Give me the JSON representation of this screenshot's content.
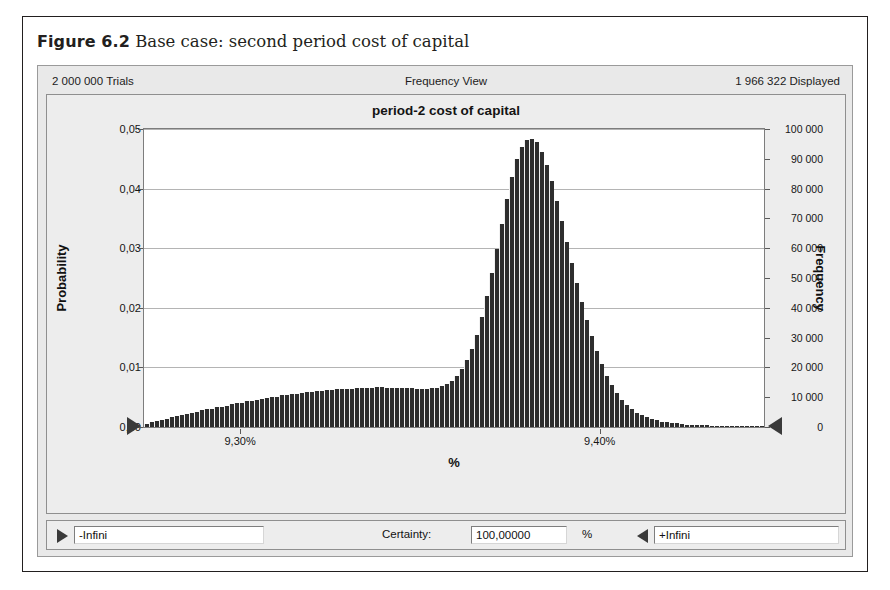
{
  "figure": {
    "label": "Figure 6.2",
    "caption": "Base case: second period cost of capital"
  },
  "window": {
    "header": {
      "trials": "2 000 000 Trials",
      "view": "Frequency View",
      "displayed": "1 966 322 Displayed"
    },
    "footer": {
      "lower_bound_value": "-Infini",
      "certainty_label": "Certainty:",
      "certainty_value": "100,00000",
      "percent_label": "%",
      "upper_bound_value": "+Infini",
      "lower_handle_icon": "triangle-right-icon",
      "upper_handle_icon": "triangle-left-icon"
    }
  },
  "chart_data": {
    "type": "bar",
    "title": "period-2 cost of capital",
    "xlabel": "%",
    "ylabel": "Probability",
    "y2label": "Frequency",
    "grid": true,
    "legend": "none",
    "ylim": [
      0,
      0.05
    ],
    "y2lim": [
      0,
      100000
    ],
    "yticks": [
      "0,00",
      "0,01",
      "0,02",
      "0,03",
      "0,04",
      "0,05"
    ],
    "ytick_values": [
      0.0,
      0.01,
      0.02,
      0.03,
      0.04,
      0.05
    ],
    "y2ticks": [
      "0",
      "10 000",
      "20 000",
      "30 000",
      "40 000",
      "50 000",
      "60 000",
      "70 000",
      "80 000",
      "90 000",
      "100 000"
    ],
    "y2tick_values": [
      0,
      10000,
      20000,
      30000,
      40000,
      50000,
      60000,
      70000,
      80000,
      90000,
      100000
    ],
    "xticks": [
      "9,30%",
      "9,40%"
    ],
    "xtick_positions": [
      0.155,
      0.735
    ],
    "xlim": [
      9.265,
      9.437
    ],
    "bar_color": "#2e2e2e",
    "n_bins": 100,
    "values": [
      0.0005,
      0.0008,
      0.001,
      0.0012,
      0.0014,
      0.0016,
      0.0018,
      0.002,
      0.0022,
      0.0024,
      0.0026,
      0.0028,
      0.003,
      0.0031,
      0.0033,
      0.0034,
      0.0036,
      0.0038,
      0.004,
      0.0041,
      0.0043,
      0.0044,
      0.0046,
      0.0047,
      0.0049,
      0.005,
      0.0051,
      0.0053,
      0.0054,
      0.0055,
      0.0056,
      0.0057,
      0.0058,
      0.0059,
      0.006,
      0.0061,
      0.0062,
      0.0062,
      0.0063,
      0.0063,
      0.0064,
      0.0064,
      0.0065,
      0.0065,
      0.0066,
      0.0066,
      0.0067,
      0.0067,
      0.0066,
      0.0066,
      0.0066,
      0.0065,
      0.0065,
      0.0065,
      0.0064,
      0.0064,
      0.0064,
      0.0065,
      0.0066,
      0.0068,
      0.0072,
      0.0078,
      0.0086,
      0.0097,
      0.0112,
      0.0131,
      0.0155,
      0.0185,
      0.022,
      0.0258,
      0.0298,
      0.034,
      0.0382,
      0.042,
      0.045,
      0.047,
      0.0481,
      0.0484,
      0.0478,
      0.0462,
      0.044,
      0.0412,
      0.038,
      0.0345,
      0.031,
      0.0275,
      0.0242,
      0.021,
      0.018,
      0.0152,
      0.0127,
      0.0105,
      0.0086,
      0.007,
      0.0057,
      0.0046,
      0.0037,
      0.003,
      0.0024,
      0.002,
      0.0016,
      0.0013,
      0.0011,
      0.0009,
      0.0008,
      0.0007,
      0.0006,
      0.0005,
      0.0004,
      0.0004,
      0.0003,
      0.0003,
      0.0003,
      0.0002,
      0.0002,
      0.0002,
      0.0002,
      0.0001,
      0.0001,
      0.0001,
      0.0001,
      0.0001,
      0.0001,
      0.0001
    ]
  }
}
